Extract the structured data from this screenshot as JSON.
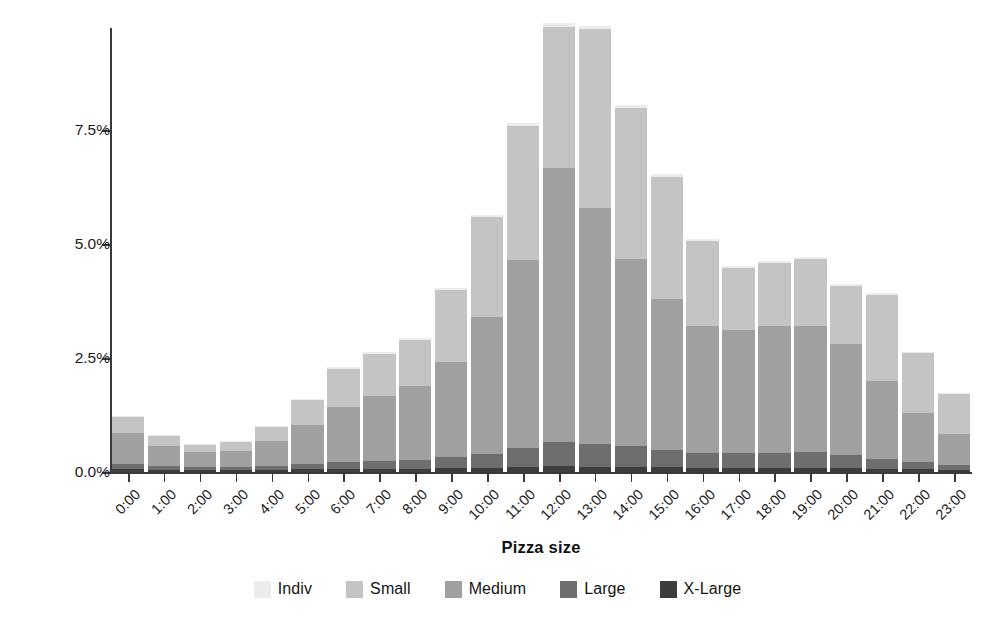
{
  "chart_data": {
    "type": "bar",
    "stacked": true,
    "title": "",
    "xlabel": "Pizza size",
    "ylabel": "Density",
    "grid": false,
    "legend_position": "bottom",
    "ylim": [
      0,
      9.9
    ],
    "ytick_labels": [
      "0.0%",
      "2.5%",
      "5.0%",
      "7.5%"
    ],
    "ytick_values": [
      0,
      2.5,
      5.0,
      7.5
    ],
    "categories": [
      "0:00",
      "1:00",
      "2:00",
      "3:00",
      "4:00",
      "5:00",
      "6:00",
      "7:00",
      "8:00",
      "9:00",
      "10:00",
      "11:00",
      "12:00",
      "13:00",
      "14:00",
      "15:00",
      "16:00",
      "17:00",
      "18:00",
      "19:00",
      "20:00",
      "21:00",
      "22:00",
      "23:00"
    ],
    "series": [
      {
        "name": "X-Large",
        "color": "#3d3d3d",
        "values": [
          0.06,
          0.05,
          0.04,
          0.04,
          0.05,
          0.06,
          0.07,
          0.07,
          0.07,
          0.08,
          0.09,
          0.11,
          0.13,
          0.12,
          0.11,
          0.1,
          0.09,
          0.09,
          0.09,
          0.09,
          0.08,
          0.07,
          0.06,
          0.05
        ]
      },
      {
        "name": "Large",
        "color": "#6e6e6e",
        "values": [
          0.11,
          0.08,
          0.06,
          0.07,
          0.09,
          0.12,
          0.16,
          0.18,
          0.2,
          0.24,
          0.31,
          0.42,
          0.52,
          0.5,
          0.45,
          0.38,
          0.33,
          0.32,
          0.33,
          0.34,
          0.29,
          0.22,
          0.16,
          0.11
        ]
      },
      {
        "name": "Medium",
        "color": "#a0a0a0",
        "values": [
          0.68,
          0.44,
          0.33,
          0.36,
          0.55,
          0.86,
          1.2,
          1.42,
          1.62,
          2.08,
          3.0,
          4.12,
          6.02,
          5.16,
          4.11,
          3.32,
          2.78,
          2.69,
          2.78,
          2.77,
          2.43,
          1.71,
          1.08,
          0.67
        ]
      },
      {
        "name": "Small",
        "color": "#c4c4c4",
        "values": [
          0.35,
          0.22,
          0.17,
          0.19,
          0.3,
          0.53,
          0.83,
          0.91,
          1.0,
          1.58,
          2.18,
          2.93,
          3.07,
          3.92,
          3.3,
          2.67,
          1.86,
          1.37,
          1.37,
          1.47,
          1.28,
          1.88,
          1.3,
          0.87
        ]
      },
      {
        "name": "Indiv",
        "color": "#ececec",
        "values": [
          0.03,
          0.02,
          0.02,
          0.02,
          0.02,
          0.03,
          0.04,
          0.04,
          0.04,
          0.05,
          0.06,
          0.07,
          0.09,
          0.08,
          0.07,
          0.06,
          0.05,
          0.05,
          0.05,
          0.05,
          0.04,
          0.04,
          0.03,
          0.03
        ]
      }
    ],
    "totals": [
      1.23,
      0.81,
      0.62,
      0.68,
      1.01,
      1.6,
      2.3,
      2.62,
      2.93,
      4.03,
      5.64,
      7.65,
      9.83,
      9.78,
      8.04,
      6.53,
      5.11,
      4.52,
      4.62,
      4.72,
      4.12,
      3.92,
      2.63,
      1.73
    ],
    "legend_entries": [
      {
        "label": "Indiv",
        "color": "#ececec"
      },
      {
        "label": "Small",
        "color": "#c4c4c4"
      },
      {
        "label": "Medium",
        "color": "#a0a0a0"
      },
      {
        "label": "Large",
        "color": "#6e6e6e"
      },
      {
        "label": "X-Large",
        "color": "#3d3d3d"
      }
    ]
  }
}
